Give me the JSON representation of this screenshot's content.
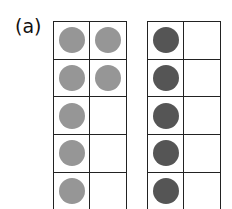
{
  "label": "(a)",
  "colors": {
    "light": "#969696",
    "dark": "#555555",
    "line": "#222222"
  },
  "frames": [
    {
      "name": "left-ten-frame",
      "color": "light",
      "cells": [
        [
          true,
          true
        ],
        [
          true,
          true
        ],
        [
          true,
          false
        ],
        [
          true,
          false
        ],
        [
          true,
          false
        ]
      ]
    },
    {
      "name": "right-ten-frame",
      "color": "dark",
      "cells": [
        [
          true,
          false
        ],
        [
          true,
          false
        ],
        [
          true,
          false
        ],
        [
          true,
          false
        ],
        [
          true,
          false
        ]
      ]
    }
  ]
}
